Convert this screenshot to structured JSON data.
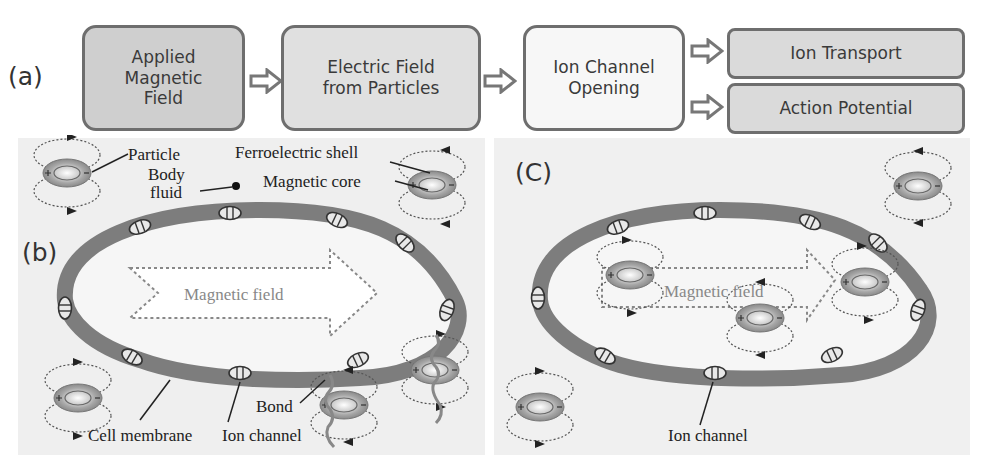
{
  "flow": {
    "label": "(a)",
    "boxes": [
      {
        "id": "applied-field",
        "text": "Applied\nMagnetic\nField"
      },
      {
        "id": "electric-field",
        "text": "Electric  Field\nfrom Particles"
      },
      {
        "id": "ion-channel-opening",
        "text": "Ion Channel\nOpening"
      },
      {
        "id": "ion-transport",
        "text": "Ion Transport"
      },
      {
        "id": "action-potential",
        "text": "Action Potential"
      }
    ],
    "arrow_icon": "hollow-right-arrow"
  },
  "panel_b": {
    "label": "(b)",
    "annotations": {
      "particle": "Particle",
      "body_fluid_1": "Body",
      "body_fluid_2": "fluid",
      "ferroelectric_shell": "Ferroelectric shell",
      "magnetic_core": "Magnetic core",
      "magnetic_field": "Magnetic field",
      "bond": "Bond",
      "cell_membrane": "Cell membrane",
      "ion_channel": "Ion channel"
    }
  },
  "panel_c": {
    "label": "(C)",
    "annotations": {
      "magnetic_field": "Magnetic field",
      "ion_channel": "Ion channel"
    }
  },
  "colors": {
    "membrane": "#7d7d7d",
    "cell_interior": "#f4f4f4",
    "panel_bg": "#efefef",
    "box_border": "#6e6e6e",
    "box_dark": "#cfcfcf",
    "box_light": "#f7f7f7"
  }
}
